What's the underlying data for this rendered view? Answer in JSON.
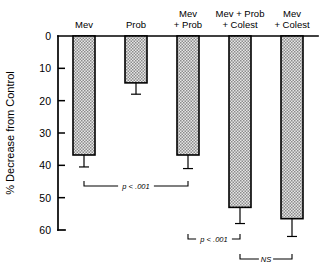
{
  "chart_data": {
    "type": "bar",
    "title": "",
    "subtitle": "",
    "xlabel": "",
    "ylabel": "% Decrease from Control",
    "categories": [
      "Mev",
      "Prob",
      "Mev + Prob",
      "Mev + Prob + Colest",
      "Mev + Colest"
    ],
    "category_lines": [
      [
        "Mev"
      ],
      [
        "Prob"
      ],
      [
        "Mev",
        "+ Prob"
      ],
      [
        "Mev + Prob",
        "+ Colest"
      ],
      [
        "Mev",
        "+ Colest"
      ]
    ],
    "values": [
      36.8,
      14.5,
      36.8,
      53.0,
      56.5
    ],
    "errors": [
      3.7,
      3.5,
      4.2,
      5.0,
      5.5
    ],
    "error_upper_values": [
      40.5,
      18.0,
      41.0,
      58.0,
      62.0
    ],
    "ylim": [
      0,
      60
    ],
    "y_inverted": true,
    "yticks": [
      0,
      10,
      20,
      30,
      40,
      50,
      60
    ],
    "ytick_labels": [
      "0",
      "10",
      "20",
      "30",
      "40",
      "50",
      "60"
    ],
    "grid": false,
    "legend": "none",
    "bar_fill": "#d8d8d8",
    "bar_edge": "#000000",
    "bar_pattern": "fine-checkerboard-stipple",
    "annotations": [
      {
        "label": "p < .001",
        "from_category": "Mev",
        "to_category": "Mev + Prob"
      },
      {
        "label": "p < .001",
        "from_category": "Mev + Prob",
        "to_category": "Mev + Prob + Colest"
      },
      {
        "label": "NS",
        "from_category": "Mev + Prob + Colest",
        "to_category": "Mev + Colest"
      }
    ]
  }
}
